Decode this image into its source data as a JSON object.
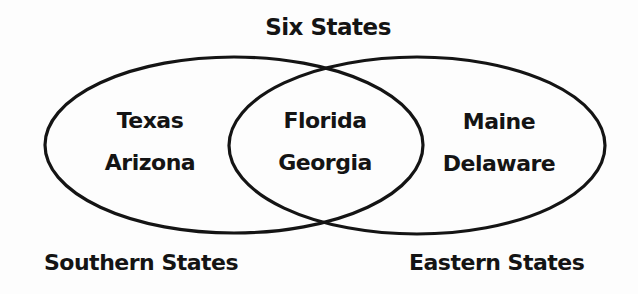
{
  "title": "Six States",
  "sets": [
    {
      "name": "Southern States",
      "only_items": [
        "Texas",
        "Arizona"
      ]
    },
    {
      "name": "Eastern States",
      "only_items": [
        "Maine",
        "Delaware"
      ]
    }
  ],
  "intersection": {
    "items": [
      "Florida",
      "Georgia"
    ]
  },
  "style": {
    "stroke_color": "#141414",
    "background": "#fdfdfd"
  }
}
